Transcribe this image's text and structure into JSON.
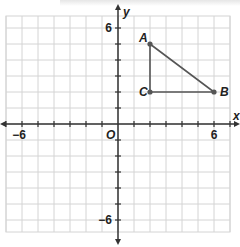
{
  "chart_data": {
    "type": "scatter",
    "title": "",
    "xlabel": "x",
    "ylabel": "y",
    "origin_label": "O",
    "xlim": [
      -7,
      7
    ],
    "ylim": [
      -7,
      7
    ],
    "grid": true,
    "x_tick_labels": [
      {
        "value": -6,
        "label": "−6"
      },
      {
        "value": 6,
        "label": "6"
      }
    ],
    "y_tick_labels": [
      {
        "value": 6,
        "label": "6"
      },
      {
        "value": -6,
        "label": "−6"
      }
    ],
    "points": [
      {
        "name": "A",
        "x": 2,
        "y": 5
      },
      {
        "name": "B",
        "x": 6,
        "y": 2
      },
      {
        "name": "C",
        "x": 2,
        "y": 2
      }
    ],
    "polygon": [
      "A",
      "B",
      "C"
    ],
    "colors": {
      "grid": "#d4d4d4",
      "axis": "#333333",
      "triangle": "#555555",
      "point": "#555555"
    }
  }
}
